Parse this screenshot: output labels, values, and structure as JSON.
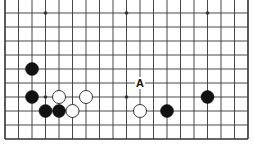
{
  "board": {
    "size": 19,
    "visible_columns": [
      0,
      18
    ],
    "visible_rows_from_bottom_edge": 10,
    "bottom_edge": true,
    "left_edge": true,
    "right_edge": true,
    "top_edge": false,
    "colors": {
      "line": "#333333",
      "black_stone": "#111111",
      "white_stone": "#ffffff",
      "background": "#ffffff"
    }
  },
  "geometry": {
    "x0": 5,
    "dx": 13.5,
    "y0": 13,
    "dy": 14,
    "rows": 10,
    "stone_radius": 6.5
  },
  "star_points": [
    {
      "col": 3,
      "row": 0
    },
    {
      "col": 9,
      "row": 0
    },
    {
      "col": 15,
      "row": 0
    },
    {
      "col": 3,
      "row": 6
    },
    {
      "col": 9,
      "row": 6
    },
    {
      "col": 15,
      "row": 6
    }
  ],
  "stones": [
    {
      "color": "black",
      "col": 2,
      "row": 4
    },
    {
      "color": "black",
      "col": 2,
      "row": 6
    },
    {
      "color": "white",
      "col": 4,
      "row": 6
    },
    {
      "color": "white",
      "col": 6,
      "row": 6
    },
    {
      "color": "black",
      "col": 3,
      "row": 7
    },
    {
      "color": "black",
      "col": 4,
      "row": 7
    },
    {
      "color": "white",
      "col": 5,
      "row": 7
    },
    {
      "color": "white",
      "col": 10,
      "row": 7
    },
    {
      "color": "black",
      "col": 12,
      "row": 7
    },
    {
      "color": "black",
      "col": 15,
      "row": 6
    }
  ],
  "labels": [
    {
      "text": "A",
      "col": 10,
      "row": 5
    }
  ]
}
